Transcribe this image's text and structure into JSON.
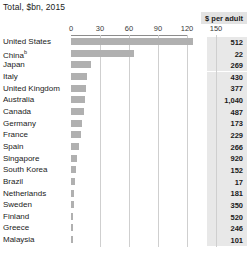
{
  "chart_data": {
    "type": "bar",
    "orientation": "horizontal",
    "title": "Total, $bn, 2015",
    "xlabel": "",
    "ylabel": "",
    "xlim": [
      0,
      150
    ],
    "xticks": [
      0,
      30,
      60,
      90,
      120,
      150
    ],
    "xtick_labels": [
      "0",
      "30",
      "60",
      "90",
      "120",
      "150"
    ],
    "grid": true,
    "legend": null,
    "value_column_header": "$ per adult",
    "categories": [
      "United States",
      "China",
      "Japan",
      "Italy",
      "United Kingdom",
      "Australia",
      "Canada",
      "Germany",
      "France",
      "Spain",
      "Singapore",
      "South Korea",
      "Brazil",
      "Netherlands",
      "Sweden",
      "Finland",
      "Greece",
      "Malaysia"
    ],
    "values": [
      126,
      65,
      21,
      17,
      15,
      14,
      13,
      11,
      10,
      8.5,
      6.5,
      5.5,
      4.5,
      3.5,
      3,
      2.5,
      2,
      1.5
    ],
    "value_column": [
      "512",
      "22",
      "269",
      "430",
      "377",
      "1,040",
      "487",
      "173",
      "229",
      "266",
      "920",
      "152",
      "17",
      "181",
      "350",
      "520",
      "246",
      "101"
    ],
    "footnote_markers": {
      "China": "b"
    }
  },
  "rows": [
    {
      "label": "United States",
      "sup": "",
      "bar": 126,
      "value": "512"
    },
    {
      "label": "China",
      "sup": "b",
      "bar": 65,
      "value": "22"
    },
    {
      "label": "Japan",
      "sup": "",
      "bar": 21,
      "value": "269"
    },
    {
      "label": "Italy",
      "sup": "",
      "bar": 17,
      "value": "430"
    },
    {
      "label": "United Kingdom",
      "sup": "",
      "bar": 15,
      "value": "377"
    },
    {
      "label": "Australia",
      "sup": "",
      "bar": 14,
      "value": "1,040"
    },
    {
      "label": "Canada",
      "sup": "",
      "bar": 13,
      "value": "487"
    },
    {
      "label": "Germany",
      "sup": "",
      "bar": 11,
      "value": "173"
    },
    {
      "label": "France",
      "sup": "",
      "bar": 10,
      "value": "229"
    },
    {
      "label": "Spain",
      "sup": "",
      "bar": 8.5,
      "value": "266"
    },
    {
      "label": "Singapore",
      "sup": "",
      "bar": 6.5,
      "value": "920"
    },
    {
      "label": "South Korea",
      "sup": "",
      "bar": 5.5,
      "value": "152"
    },
    {
      "label": "Brazil",
      "sup": "",
      "bar": 4.5,
      "value": "17"
    },
    {
      "label": "Netherlands",
      "sup": "",
      "bar": 3.5,
      "value": "181"
    },
    {
      "label": "Sweden",
      "sup": "",
      "bar": 3,
      "value": "350"
    },
    {
      "label": "Finland",
      "sup": "",
      "bar": 2.5,
      "value": "520"
    },
    {
      "label": "Greece",
      "sup": "",
      "bar": 2,
      "value": "246"
    },
    {
      "label": "Malaysia",
      "sup": "",
      "bar": 1.5,
      "value": "101"
    }
  ],
  "colors": {
    "bar": "#b0b0b0",
    "grid": "#cfcfcf",
    "baseline": "#8c8c8c",
    "value_box": "#e8e8e8",
    "badge": "#e3e3e3",
    "text": "#1a1a1a"
  }
}
